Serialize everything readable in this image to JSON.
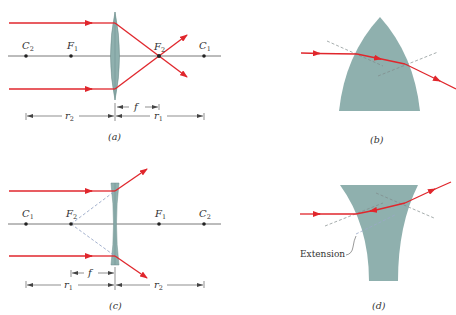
{
  "colors": {
    "ray": "#e0262c",
    "axis": "#555555",
    "lens_fill": "#8fb0ae",
    "lens_stroke": "#6f8f8d",
    "dashed_normal": "#7f8a8a",
    "virtual_ray": "#9aa8c8",
    "text": "#333333"
  },
  "panels": {
    "a": {
      "caption": "(a)",
      "type": "converging lens",
      "points": [
        {
          "name": "C",
          "sub": "2"
        },
        {
          "name": "F",
          "sub": "1"
        },
        {
          "name": "F",
          "sub": "2"
        },
        {
          "name": "C",
          "sub": "1"
        }
      ],
      "dims": {
        "f": "f",
        "r_left": {
          "name": "r",
          "sub": "2"
        },
        "r_right": {
          "name": "r",
          "sub": "1"
        }
      }
    },
    "b": {
      "caption": "(b)",
      "type": "convex lens section with refraction"
    },
    "c": {
      "caption": "(c)",
      "type": "diverging lens",
      "points": [
        {
          "name": "C",
          "sub": "1"
        },
        {
          "name": "F",
          "sub": "2"
        },
        {
          "name": "F",
          "sub": "1"
        },
        {
          "name": "C",
          "sub": "2"
        }
      ],
      "dims": {
        "f": "f",
        "r_left": {
          "name": "r",
          "sub": "1"
        },
        "r_right": {
          "name": "r",
          "sub": "2"
        }
      }
    },
    "d": {
      "caption": "(d)",
      "type": "concave lens section with refraction",
      "annotation": "Extension"
    }
  }
}
